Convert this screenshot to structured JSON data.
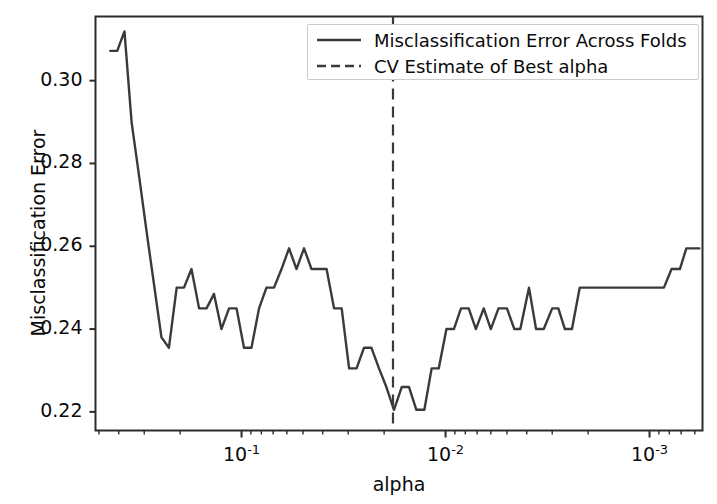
{
  "chart_data": {
    "type": "line",
    "title": "",
    "xlabel": "alpha",
    "ylabel": "Misclassification Error",
    "xscale": "log",
    "x_inverted": true,
    "grid": false,
    "legend_position": "upper right",
    "xlim": [
      0.52,
      0.00055
    ],
    "ylim": [
      0.2155,
      0.3155
    ],
    "ytick_labels": [
      "0.30",
      "0.28",
      "0.26",
      "0.24",
      "0.22"
    ],
    "ytick_values": [
      0.3,
      0.28,
      0.26,
      0.24,
      0.22
    ],
    "xtick_labels": [
      "10⁻¹",
      "10⁻²",
      "10⁻³"
    ],
    "xtick_values": [
      0.1,
      0.01,
      0.001
    ],
    "xtick_mantissas": [
      "10",
      "10",
      "10"
    ],
    "xtick_exponents": [
      "-1",
      "-2",
      "-3"
    ],
    "series": [
      {
        "name": "Misclassification Error Across Folds",
        "color": "#3a3a3a",
        "linestyle": "solid",
        "linewidth": 2.4,
        "x": [
          0.44,
          0.407,
          0.375,
          0.346,
          0.318,
          0.293,
          0.269,
          0.247,
          0.227,
          0.208,
          0.1915,
          0.176,
          0.1615,
          0.1485,
          0.1365,
          0.1255,
          0.1152,
          0.1058,
          0.0973,
          0.0894,
          0.0821,
          0.0755,
          0.0693,
          0.0637,
          0.0585,
          0.0538,
          0.0494,
          0.0454,
          0.0417,
          0.0383,
          0.0352,
          0.0323,
          0.0297,
          0.0273,
          0.0251,
          0.0231,
          0.0212,
          0.0195,
          0.0179,
          0.0164,
          0.0151,
          0.0139,
          0.0127,
          0.0117,
          0.0108,
          0.0099,
          0.0091,
          0.0084,
          0.0077,
          0.0071,
          0.0065,
          0.006,
          0.0055,
          0.005,
          0.0046,
          0.0043,
          0.0039,
          0.0036,
          0.0033,
          0.003,
          0.0028,
          0.0026,
          0.0024,
          0.0022,
          0.002,
          0.0018,
          0.0017,
          0.0015,
          0.0014,
          0.0013,
          0.0012,
          0.0011,
          0.001,
          0.00092,
          0.00085,
          0.00078,
          0.00071,
          0.00066,
          0.0006,
          0.00057
        ],
        "y": [
          0.3072,
          0.3072,
          0.3119,
          0.29,
          0.277,
          0.264,
          0.251,
          0.238,
          0.2355,
          0.25,
          0.25,
          0.2545,
          0.245,
          0.245,
          0.2485,
          0.24,
          0.245,
          0.245,
          0.2355,
          0.2355,
          0.245,
          0.25,
          0.25,
          0.2545,
          0.2595,
          0.2545,
          0.2595,
          0.2545,
          0.2545,
          0.2545,
          0.245,
          0.245,
          0.2305,
          0.2305,
          0.2355,
          0.2355,
          0.2305,
          0.226,
          0.2205,
          0.226,
          0.226,
          0.2205,
          0.2205,
          0.2305,
          0.2305,
          0.24,
          0.24,
          0.245,
          0.245,
          0.24,
          0.245,
          0.24,
          0.245,
          0.245,
          0.24,
          0.24,
          0.25,
          0.24,
          0.24,
          0.245,
          0.245,
          0.24,
          0.24,
          0.25,
          0.25,
          0.25,
          0.25,
          0.25,
          0.25,
          0.25,
          0.25,
          0.25,
          0.25,
          0.25,
          0.25,
          0.2545,
          0.2545,
          0.2595,
          0.2595,
          0.2595
        ]
      }
    ],
    "vlines": [
      {
        "name": "CV Estimate of Best alpha",
        "x": 0.0181,
        "color": "#3a3a3a",
        "linestyle": "dashed",
        "linewidth": 2.2
      }
    ],
    "legend_entries": [
      {
        "label": "Misclassification Error Across Folds",
        "style": "solid",
        "color": "#3a3a3a"
      },
      {
        "label": "CV Estimate of Best alpha",
        "style": "dashed",
        "color": "#3a3a3a"
      }
    ]
  },
  "axes": {
    "spine_color": "#2b2b2b",
    "background": "#ffffff",
    "tick_color": "#2b2b2b"
  }
}
